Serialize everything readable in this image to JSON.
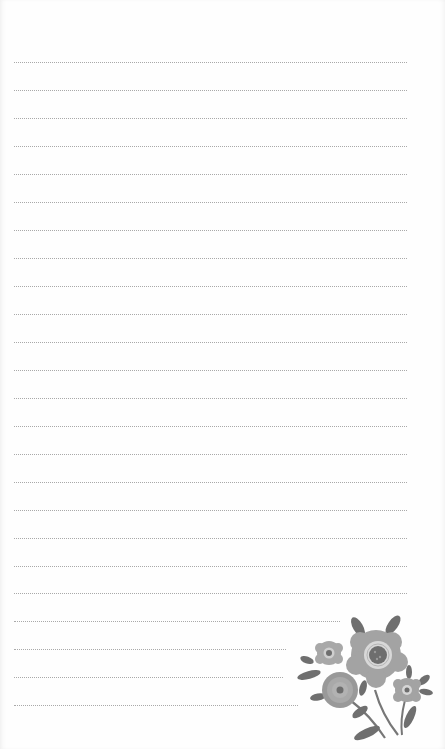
{
  "page": {
    "type": "lined-notepaper",
    "background": "#fefefe",
    "line_color": "#a9a9a9",
    "line_style": "dotted",
    "title": ""
  },
  "lines": [
    {
      "y": 62,
      "x1": 14,
      "x2": 407
    },
    {
      "y": 90,
      "x1": 14,
      "x2": 407
    },
    {
      "y": 118,
      "x1": 14,
      "x2": 407
    },
    {
      "y": 146,
      "x1": 14,
      "x2": 407
    },
    {
      "y": 174,
      "x1": 14,
      "x2": 407
    },
    {
      "y": 202,
      "x1": 14,
      "x2": 407
    },
    {
      "y": 230,
      "x1": 14,
      "x2": 407
    },
    {
      "y": 258,
      "x1": 14,
      "x2": 407
    },
    {
      "y": 286,
      "x1": 14,
      "x2": 407
    },
    {
      "y": 314,
      "x1": 14,
      "x2": 407
    },
    {
      "y": 342,
      "x1": 14,
      "x2": 407
    },
    {
      "y": 370,
      "x1": 14,
      "x2": 407
    },
    {
      "y": 398,
      "x1": 14,
      "x2": 407
    },
    {
      "y": 426,
      "x1": 14,
      "x2": 407
    },
    {
      "y": 454,
      "x1": 14,
      "x2": 407
    },
    {
      "y": 482,
      "x1": 14,
      "x2": 407
    },
    {
      "y": 510,
      "x1": 14,
      "x2": 407
    },
    {
      "y": 538,
      "x1": 14,
      "x2": 407
    },
    {
      "y": 566,
      "x1": 14,
      "x2": 407
    },
    {
      "y": 593,
      "x1": 14,
      "x2": 407
    },
    {
      "y": 621,
      "x1": 14,
      "x2": 340
    },
    {
      "y": 649,
      "x1": 14,
      "x2": 286
    },
    {
      "y": 677,
      "x1": 14,
      "x2": 283
    },
    {
      "y": 705,
      "x1": 14,
      "x2": 298
    }
  ],
  "decoration": {
    "name": "floral-corner",
    "colors": {
      "petal_light": "#a8a8a8",
      "petal_mid": "#999999",
      "center_dark": "#6e6e6e",
      "leaf": "#6f6f6f",
      "ring": "#d8d8d8"
    }
  }
}
